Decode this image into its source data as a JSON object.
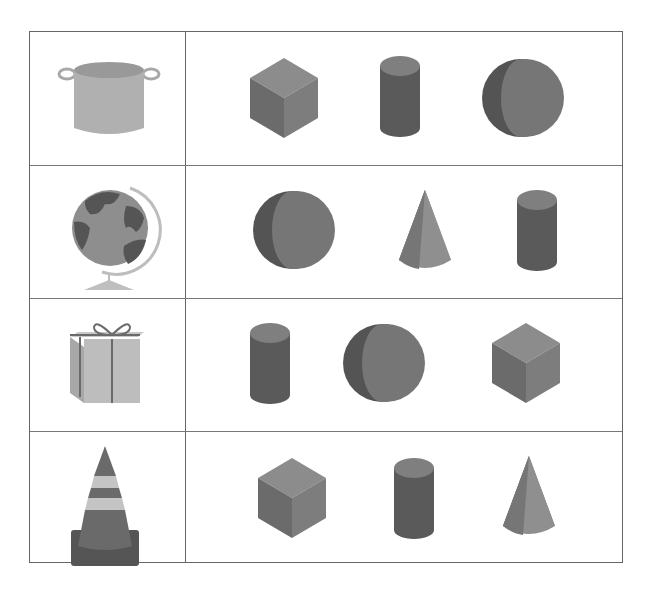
{
  "worksheet": {
    "rows": [
      {
        "object": "pot",
        "options": [
          "cube",
          "cylinder",
          "sphere"
        ]
      },
      {
        "object": "globe",
        "options": [
          "sphere",
          "cone",
          "cylinder"
        ]
      },
      {
        "object": "gift-box",
        "options": [
          "cylinder",
          "sphere",
          "cube"
        ]
      },
      {
        "object": "traffic-cone",
        "options": [
          "cube",
          "cylinder",
          "cone"
        ]
      }
    ]
  },
  "colors": {
    "border": "#666666",
    "shape_light": "#8a8a8a",
    "shape_mid": "#6f6f6f",
    "shape_dark": "#555555",
    "object_light": "#b5b5b5"
  }
}
